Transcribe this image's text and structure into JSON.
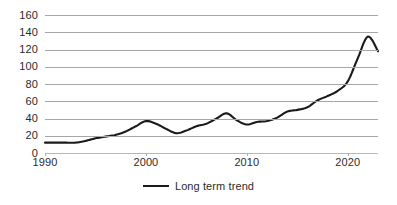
{
  "chart_data": {
    "type": "line",
    "title": "",
    "xlabel": "",
    "ylabel": "",
    "xlim": [
      1990,
      2023
    ],
    "ylim": [
      0,
      160
    ],
    "grid": true,
    "legend_position": "bottom-center",
    "y_ticks": [
      160,
      140,
      120,
      100,
      80,
      60,
      40,
      20,
      0
    ],
    "x_ticks": [
      1990,
      2000,
      2010,
      2020
    ],
    "series": [
      {
        "name": "Long term trend",
        "color": "#1a1a1a",
        "x": [
          1990,
          1991,
          1992,
          1993,
          1994,
          1995,
          1996,
          1997,
          1998,
          1999,
          2000,
          2001,
          2002,
          2003,
          2004,
          2005,
          2006,
          2007,
          2008,
          2009,
          2010,
          2011,
          2012,
          2013,
          2014,
          2015,
          2016,
          2017,
          2018,
          2019,
          2020,
          2021,
          2022,
          2023
        ],
        "values": [
          12,
          12,
          12,
          12,
          14,
          17,
          19,
          21,
          25,
          31,
          37,
          34,
          28,
          23,
          26,
          31,
          34,
          40,
          46,
          38,
          33,
          36,
          37,
          41,
          48,
          50,
          53,
          61,
          66,
          72,
          83,
          110,
          135,
          118
        ]
      }
    ]
  },
  "legend": {
    "label": "Long term trend"
  },
  "axis": {
    "y_labels": [
      "160",
      "140",
      "120",
      "100",
      "80",
      "60",
      "40",
      "20",
      "0"
    ],
    "x_labels": [
      "1990",
      "2000",
      "2010",
      "2020"
    ]
  }
}
